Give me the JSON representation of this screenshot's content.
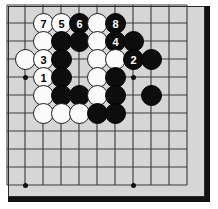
{
  "figure": {
    "kind": "go-board-diagram",
    "board_background": "#d6d6d6",
    "line_color": "#3a3a3a",
    "frame_color": "#111111",
    "black_color": "#0d0d0d",
    "white_color": "#fbfbfb",
    "grid_spacing_px": 18,
    "grid_origin": {
      "x": 7,
      "y": 5
    },
    "columns_px": [
      7,
      25,
      43,
      61,
      79,
      97,
      115,
      133,
      151,
      169,
      187
    ],
    "rows_px": [
      5,
      23,
      41,
      59,
      77,
      95,
      113,
      131,
      149,
      167,
      185
    ],
    "star_points": [
      {
        "col": 1,
        "row": 4
      },
      {
        "col": 1,
        "row": 10
      },
      {
        "col": 7,
        "row": 4
      },
      {
        "col": 7,
        "row": 10
      }
    ]
  },
  "stones": [
    {
      "col": 2,
      "row": 1,
      "color": "white",
      "label": "7"
    },
    {
      "col": 3,
      "row": 1,
      "color": "white",
      "label": "5"
    },
    {
      "col": 4,
      "row": 1,
      "color": "black",
      "label": "6"
    },
    {
      "col": 5,
      "row": 1,
      "color": "white",
      "label": ""
    },
    {
      "col": 6,
      "row": 1,
      "color": "black",
      "label": "8"
    },
    {
      "col": 2,
      "row": 2,
      "color": "white",
      "label": ""
    },
    {
      "col": 3,
      "row": 2,
      "color": "black",
      "label": ""
    },
    {
      "col": 4,
      "row": 2,
      "color": "black",
      "label": ""
    },
    {
      "col": 5,
      "row": 2,
      "color": "white",
      "label": ""
    },
    {
      "col": 6,
      "row": 2,
      "color": "black",
      "label": "4"
    },
    {
      "col": 7,
      "row": 2,
      "color": "black",
      "label": ""
    },
    {
      "col": 1,
      "row": 3,
      "color": "white",
      "label": ""
    },
    {
      "col": 2,
      "row": 3,
      "color": "white",
      "label": "3"
    },
    {
      "col": 3,
      "row": 3,
      "color": "black",
      "label": ""
    },
    {
      "col": 5,
      "row": 3,
      "color": "white",
      "label": ""
    },
    {
      "col": 6,
      "row": 3,
      "color": "white",
      "label": ""
    },
    {
      "col": 7,
      "row": 3,
      "color": "black",
      "label": "2"
    },
    {
      "col": 8,
      "row": 3,
      "color": "black",
      "label": ""
    },
    {
      "col": 2,
      "row": 4,
      "color": "white",
      "label": "1"
    },
    {
      "col": 3,
      "row": 4,
      "color": "black",
      "label": ""
    },
    {
      "col": 5,
      "row": 4,
      "color": "white",
      "label": ""
    },
    {
      "col": 6,
      "row": 4,
      "color": "black",
      "label": ""
    },
    {
      "col": 2,
      "row": 5,
      "color": "white",
      "label": ""
    },
    {
      "col": 3,
      "row": 5,
      "color": "black",
      "label": ""
    },
    {
      "col": 4,
      "row": 5,
      "color": "black",
      "label": ""
    },
    {
      "col": 5,
      "row": 5,
      "color": "white",
      "label": ""
    },
    {
      "col": 6,
      "row": 5,
      "color": "black",
      "label": ""
    },
    {
      "col": 8,
      "row": 5,
      "color": "black",
      "label": ""
    },
    {
      "col": 2,
      "row": 6,
      "color": "white",
      "label": ""
    },
    {
      "col": 3,
      "row": 6,
      "color": "white",
      "label": ""
    },
    {
      "col": 4,
      "row": 6,
      "color": "white",
      "label": ""
    },
    {
      "col": 5,
      "row": 6,
      "color": "black",
      "label": ""
    },
    {
      "col": 6,
      "row": 6,
      "color": "black",
      "label": ""
    }
  ],
  "move_sequence": [
    "1",
    "2",
    "3",
    "4",
    "5",
    "6",
    "7",
    "8"
  ]
}
